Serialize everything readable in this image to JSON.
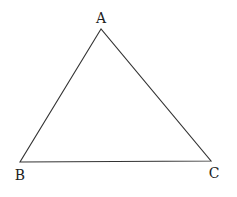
{
  "diagram": {
    "type": "triangle",
    "stroke_color": "#333333",
    "vertices": [
      {
        "label": "A",
        "x": 101,
        "y": 29,
        "label_x": 101,
        "label_y": 23
      },
      {
        "label": "B",
        "x": 20,
        "y": 162,
        "label_x": 20,
        "label_y": 180
      },
      {
        "label": "C",
        "x": 211,
        "y": 161,
        "label_x": 214,
        "label_y": 178
      }
    ]
  }
}
